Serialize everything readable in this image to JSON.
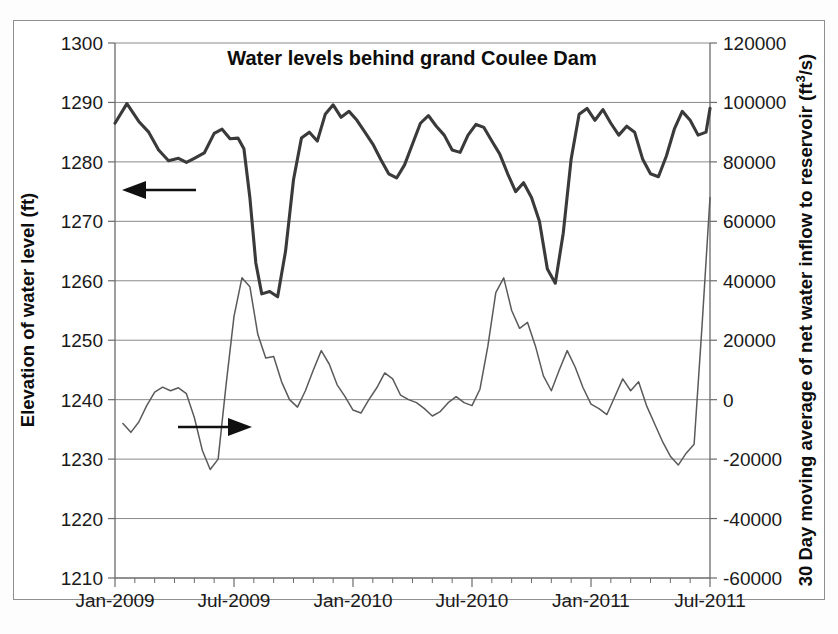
{
  "chart_data": {
    "type": "line",
    "title": "Water levels behind grand Coulee Dam",
    "xlabel": "",
    "ylabel": "Elevation of water level (ft)",
    "y2label": "30 Day moving average of net water inflow to reservoir (ft3/s)",
    "y2label_prefix": "30 Day moving average of net water inflow to reservoir (ft",
    "y2label_sup": "3",
    "y2label_suffix": "/s)",
    "grid": true,
    "legend": "none",
    "annotations": [
      {
        "name": "left-axis-arrow",
        "text": "",
        "direction": "left",
        "points_to": "Elevation of water level (ft)"
      },
      {
        "name": "right-axis-arrow",
        "text": "",
        "direction": "right",
        "points_to": "30 Day moving average of net water inflow to reservoir (ft3/s)"
      }
    ],
    "xlim": [
      "Jan-2009",
      "Jul-2011"
    ],
    "x_tick_labels": [
      "Jan-2009",
      "Jul-2009",
      "Jan-2010",
      "Jul-2010",
      "Jan-2011",
      "Jul-2011"
    ],
    "x_minor_ticks_per_interval": 6,
    "ylim": [
      1210,
      1300
    ],
    "y_ticks": [
      1210,
      1220,
      1230,
      1240,
      1250,
      1260,
      1270,
      1280,
      1290,
      1300
    ],
    "y2lim": [
      -60000,
      120000
    ],
    "y2_ticks": [
      -60000,
      -40000,
      -20000,
      0,
      20000,
      40000,
      60000,
      80000,
      100000,
      120000
    ],
    "series": [
      {
        "name": "Elevation of water level (ft)",
        "axis": "left",
        "style": "thick-dark",
        "color": "#3a3a3a",
        "x_months": [
          0.0,
          0.6,
          1.2,
          1.7,
          2.2,
          2.7,
          3.2,
          3.6,
          4.0,
          4.5,
          5.0,
          5.4,
          5.8,
          6.2,
          6.5,
          6.8,
          7.1,
          7.4,
          7.8,
          8.2,
          8.6,
          9.0,
          9.4,
          9.8,
          10.2,
          10.6,
          11.0,
          11.4,
          11.8,
          12.2,
          12.6,
          13.0,
          13.4,
          13.8,
          14.2,
          14.6,
          15.0,
          15.4,
          15.8,
          16.2,
          16.6,
          17.0,
          17.4,
          17.8,
          18.2,
          18.6,
          19.0,
          19.4,
          19.8,
          20.2,
          20.6,
          21.0,
          21.4,
          21.8,
          22.2,
          22.6,
          23.0,
          23.4,
          23.8,
          24.2,
          24.6,
          25.0,
          25.4,
          25.8,
          26.2,
          26.6,
          27.0,
          27.4,
          27.8,
          28.2,
          28.6,
          29.0,
          29.4,
          29.8,
          30.0
        ],
        "values": [
          1286.5,
          1289.8,
          1286.8,
          1285.0,
          1282.0,
          1280.2,
          1280.6,
          1279.9,
          1280.6,
          1281.5,
          1284.8,
          1285.5,
          1283.9,
          1284.0,
          1282.2,
          1274.0,
          1263.0,
          1257.8,
          1258.2,
          1257.3,
          1265.0,
          1277.0,
          1284.0,
          1285.0,
          1283.5,
          1288.0,
          1289.6,
          1287.5,
          1288.5,
          1287.0,
          1285.0,
          1283.0,
          1280.4,
          1278.0,
          1277.3,
          1279.5,
          1283.0,
          1286.5,
          1287.8,
          1286.0,
          1284.5,
          1282.0,
          1281.6,
          1284.5,
          1286.3,
          1285.8,
          1283.5,
          1281.3,
          1278.0,
          1275.0,
          1276.5,
          1274.0,
          1270.0,
          1262.0,
          1259.6,
          1268.0,
          1280.5,
          1288.0,
          1289.0,
          1287.0,
          1288.8,
          1286.5,
          1284.5,
          1286.0,
          1285.0,
          1280.5,
          1278.0,
          1277.5,
          1281.0,
          1285.5,
          1288.5,
          1287.0,
          1284.5,
          1285.0,
          1289.0
        ]
      },
      {
        "name": "30 Day moving average of net water inflow to reservoir (ft3/s)",
        "axis": "right",
        "style": "thin-gray",
        "color": "#5a5a5a",
        "x_months": [
          0.4,
          0.8,
          1.2,
          1.6,
          2.0,
          2.4,
          2.8,
          3.2,
          3.6,
          4.0,
          4.4,
          4.8,
          5.2,
          5.6,
          6.0,
          6.4,
          6.8,
          7.2,
          7.6,
          8.0,
          8.4,
          8.8,
          9.2,
          9.6,
          10.0,
          10.4,
          10.8,
          11.2,
          11.6,
          12.0,
          12.4,
          12.8,
          13.2,
          13.6,
          14.0,
          14.4,
          14.8,
          15.2,
          15.6,
          16.0,
          16.4,
          16.8,
          17.2,
          17.6,
          18.0,
          18.4,
          18.8,
          19.2,
          19.6,
          20.0,
          20.4,
          20.8,
          21.2,
          21.6,
          22.0,
          22.4,
          22.8,
          23.2,
          23.6,
          24.0,
          24.4,
          24.8,
          25.2,
          25.6,
          26.0,
          26.4,
          26.8,
          27.2,
          27.6,
          28.0,
          28.4,
          28.8,
          29.2,
          29.6,
          30.0
        ],
        "values": [
          -8000,
          -11000,
          -7500,
          -2000,
          2500,
          4200,
          3000,
          4000,
          2000,
          -6000,
          -17000,
          -23500,
          -20000,
          5000,
          28000,
          41000,
          38000,
          22000,
          14000,
          14500,
          6000,
          0,
          -2500,
          3000,
          10000,
          16500,
          12000,
          5000,
          1000,
          -3500,
          -4500,
          0,
          4000,
          9000,
          7000,
          1500,
          0,
          -1000,
          -3000,
          -5500,
          -4000,
          -1000,
          1000,
          -1000,
          -2000,
          3500,
          18000,
          36000,
          41000,
          30000,
          24000,
          26000,
          18000,
          8000,
          3000,
          10000,
          16500,
          11000,
          4000,
          -1500,
          -3000,
          -5000,
          1000,
          7000,
          3000,
          6000,
          -2000,
          -8000,
          -14000,
          -19000,
          -22000,
          -18000,
          -15000,
          25000,
          68000
        ]
      }
    ]
  },
  "axes": {
    "left": {
      "title": "Elevation of water level (ft)",
      "labels": [
        "1300",
        "1290",
        "1280",
        "1270",
        "1260",
        "1250",
        "1240",
        "1230",
        "1220",
        "1210"
      ]
    },
    "right": {
      "title_prefix": "30 Day moving average of net water inflow to reservoir (ft",
      "title_sup": "3",
      "title_suffix": "/s)",
      "labels": [
        "120000",
        "100000",
        "80000",
        "60000",
        "40000",
        "20000",
        "0",
        "-20000",
        "-40000",
        "-60000"
      ]
    },
    "bottom": {
      "labels": [
        "Jan-2009",
        "Jul-2009",
        "Jan-2010",
        "Jul-2010",
        "Jan-2011",
        "Jul-2011"
      ]
    }
  },
  "title": "Water levels behind grand Coulee Dam"
}
